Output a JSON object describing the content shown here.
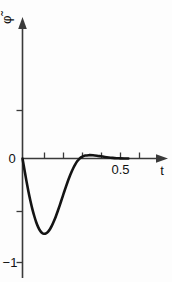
{
  "figure": {
    "background_color": "#fdfdfd",
    "ink_color": "#141414",
    "axis_color": "#3a3a3a"
  },
  "axes": {
    "y_axis_label": "φ̃",
    "y_axis_label_plain": "phi-tilde",
    "x_axis_label": "t",
    "y_tick_labels": [
      "0",
      "−1"
    ],
    "x_tick_labels": [
      "0.5"
    ]
  },
  "chart_data": {
    "type": "line",
    "title": "",
    "subtitle": "",
    "xlabel": "t",
    "ylabel": "φ̃",
    "xlim": [
      0,
      0.7
    ],
    "ylim": [
      -1.05,
      0.55
    ],
    "grid": false,
    "legend": null,
    "x_ticks": [
      0,
      0.1,
      0.2,
      0.3,
      0.4,
      0.5,
      0.6
    ],
    "x_tick_labels": [
      "",
      "",
      "",
      "",
      "",
      "0.5",
      ""
    ],
    "y_ticks": [
      0.5,
      0,
      -0.5,
      -1
    ],
    "y_tick_labels": [
      "",
      "0",
      "",
      "−1"
    ],
    "series": [
      {
        "name": "phi-tilde(t)",
        "x": [
          0.0,
          0.01,
          0.02,
          0.03,
          0.04,
          0.05,
          0.06,
          0.07,
          0.08,
          0.09,
          0.1,
          0.11,
          0.12,
          0.13,
          0.14,
          0.15,
          0.16,
          0.17,
          0.18,
          0.19,
          0.2,
          0.21,
          0.22,
          0.23,
          0.24,
          0.25,
          0.26,
          0.27,
          0.28,
          0.29,
          0.3,
          0.32,
          0.34,
          0.36,
          0.38,
          0.4,
          0.42,
          0.44,
          0.46,
          0.48,
          0.5,
          0.52,
          0.54
        ],
        "y": [
          0.0,
          -0.108,
          -0.215,
          -0.315,
          -0.404,
          -0.484,
          -0.553,
          -0.613,
          -0.66,
          -0.695,
          -0.716,
          -0.724,
          -0.72,
          -0.705,
          -0.68,
          -0.646,
          -0.604,
          -0.557,
          -0.505,
          -0.45,
          -0.393,
          -0.336,
          -0.28,
          -0.226,
          -0.176,
          -0.13,
          -0.089,
          -0.054,
          -0.025,
          -0.003,
          0.012,
          0.028,
          0.032,
          0.031,
          0.027,
          0.021,
          0.015,
          0.01,
          0.006,
          0.003,
          0.001,
          0.0,
          0.0
        ]
      }
    ],
    "annotations": [
      {
        "text": "minimum",
        "x": 0.11,
        "y": -0.724
      },
      {
        "text": "zero-crossing",
        "x": 0.292,
        "y": 0.0
      },
      {
        "text": "secondary-maximum",
        "x": 0.345,
        "y": 0.032
      }
    ]
  }
}
